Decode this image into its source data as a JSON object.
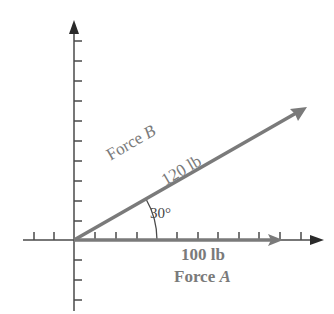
{
  "diagram": {
    "type": "vector diagram",
    "colors": {
      "axis": "#4a4a4a",
      "vector": "#7a7a7a",
      "label": "#7a7a7a"
    },
    "angle_label": "30°",
    "force_a": {
      "name": "Force",
      "letter": "A",
      "magnitude": "100 lb",
      "angle_deg": 0
    },
    "force_b": {
      "name": "Force",
      "letter": "B",
      "magnitude": "120 lb",
      "angle_deg": 30
    }
  }
}
